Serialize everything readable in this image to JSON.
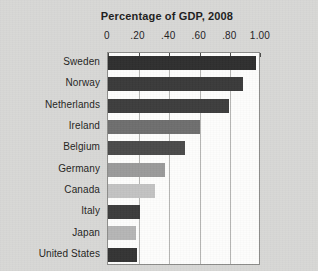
{
  "chart_data": {
    "type": "bar",
    "orientation": "horizontal",
    "title": "Percentage of GDP, 2008",
    "xlabel": "",
    "ylabel": "",
    "xlim": [
      0,
      1.0
    ],
    "grid": true,
    "legend": false,
    "tick_labels": [
      "0",
      ".20",
      ".40",
      ".60",
      ".80",
      "1.00"
    ],
    "tick_values": [
      0,
      0.2,
      0.4,
      0.6,
      0.8,
      1.0
    ],
    "categories": [
      "Sweden",
      "Norway",
      "Netherlands",
      "Ireland",
      "Belgium",
      "Germany",
      "Canada",
      "Italy",
      "Japan",
      "United States"
    ],
    "values": [
      0.97,
      0.88,
      0.79,
      0.6,
      0.5,
      0.37,
      0.31,
      0.21,
      0.18,
      0.19
    ],
    "bar_colors": [
      "#2f2f2f",
      "#3a3a3a",
      "#3d3d3d",
      "#6e6e6e",
      "#4a4a4a",
      "#9a9a9a",
      "#c2c2c2",
      "#3c3c3c",
      "#b5b5b5",
      "#343434"
    ]
  },
  "colors": {
    "page_background": "#d8d8d6",
    "plot_background": "#fdfdfc",
    "plot_border": "#8c8c8a",
    "gridline": "#b4b4b2",
    "text": "#1d1d1d"
  }
}
